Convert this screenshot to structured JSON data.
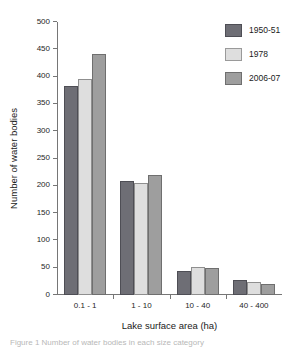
{
  "chart_data": {
    "type": "bar",
    "title": "",
    "xlabel": "Lake surface area (ha)",
    "ylabel": "Number of water bodies",
    "categories": [
      "0.1 - 1",
      "1 - 10",
      "10 - 40",
      "40 - 400"
    ],
    "series": [
      {
        "name": "1950-51",
        "color": "#6e6e75",
        "values": [
          382,
          208,
          44,
          27
        ]
      },
      {
        "name": "1978",
        "color": "#dedede",
        "values": [
          396,
          205,
          51,
          23
        ]
      },
      {
        "name": "2006-07",
        "color": "#9e9e9e",
        "values": [
          441,
          219,
          50,
          20
        ]
      }
    ],
    "ylim": [
      0,
      500
    ],
    "yticks": [
      0,
      50,
      100,
      150,
      200,
      250,
      300,
      350,
      400,
      450,
      500
    ],
    "ytick_labels": [
      "0",
      "50",
      "100",
      "150",
      "200",
      "250",
      "300",
      "350",
      "400",
      "450",
      "500"
    ],
    "grid": false,
    "legend_position": "top-right"
  },
  "caption": {
    "text": "Figure 1 Number of water bodies in each size category"
  }
}
